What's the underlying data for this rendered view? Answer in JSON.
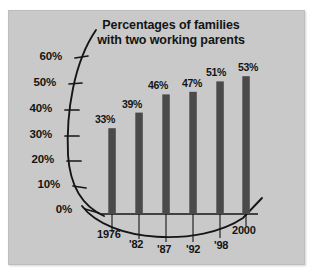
{
  "figure": {
    "background_color": "#ffffff",
    "plate_color": "#c9c9c9",
    "bar_color": "#4a4a4a",
    "axis_color": "#1a1a1a",
    "text_color": "#141414"
  },
  "chart_data": {
    "type": "bar",
    "title": "Percentages of families with two working parents",
    "title_line1": "Percentages of families",
    "title_line2": "with two working parents",
    "xlabel": "",
    "ylabel": "",
    "categories": [
      "1976",
      "'82",
      "'87",
      "'92",
      "'98",
      "2000"
    ],
    "values": [
      33,
      39,
      46,
      47,
      51,
      53
    ],
    "value_labels": [
      "33%",
      "39%",
      "46%",
      "47%",
      "51%",
      "53%"
    ],
    "ylim": [
      0,
      60
    ],
    "ytick_values": [
      60,
      50,
      40,
      30,
      20,
      10,
      0
    ],
    "ytick_labels": [
      "60%",
      "50%",
      "40%",
      "30%",
      "20%",
      "10%",
      "0%"
    ],
    "grid": false,
    "legend": null,
    "axis_style": "curved-arc",
    "note": "Y axis drawn as a left-bulging arc; X axis drawn as a downward-bulging arc beneath a straight baseline."
  }
}
